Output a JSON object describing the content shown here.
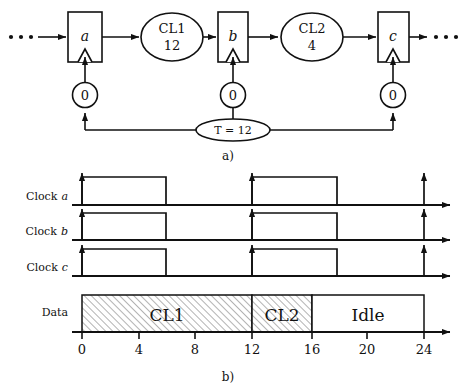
{
  "figure": {
    "panel_a": {
      "caption": "a)",
      "left_ellipsis": "• • •",
      "right_ellipsis": "• • •",
      "registers": [
        {
          "name": "register-a",
          "label": "a"
        },
        {
          "name": "register-b",
          "label": "b"
        },
        {
          "name": "register-c",
          "label": "c"
        }
      ],
      "logic_blocks": [
        {
          "name": "CL1",
          "title": "CL1",
          "delay": "12"
        },
        {
          "name": "CL2",
          "title": "CL2",
          "delay": "4"
        }
      ],
      "buffers": [
        {
          "name": "clock-buffer-a",
          "label": "0"
        },
        {
          "name": "clock-buffer-b",
          "label": "0"
        },
        {
          "name": "clock-buffer-c",
          "label": "0"
        }
      ],
      "clock_source": {
        "label": "T = 12"
      }
    },
    "panel_b": {
      "caption": "b)",
      "rows": [
        {
          "name": "clock-a",
          "label": "Clock a",
          "label_plain": "Clock",
          "label_italic": "a"
        },
        {
          "name": "clock-b",
          "label": "Clock b",
          "label_plain": "Clock",
          "label_italic": "b"
        },
        {
          "name": "clock-c",
          "label": "Clock c",
          "label_plain": "Clock",
          "label_italic": "c"
        },
        {
          "name": "data",
          "label": "Data",
          "label_plain": "Data",
          "label_italic": ""
        }
      ],
      "axis": {
        "ticks": [
          "0",
          "4",
          "8",
          "12",
          "16",
          "20",
          "24"
        ],
        "tick_values": [
          0,
          4,
          8,
          12,
          16,
          20,
          24
        ],
        "min": 0,
        "max": 25
      },
      "clock_waveform": {
        "pulses": [
          {
            "rise": 0,
            "fall": 6
          },
          {
            "rise": 12,
            "fall": 18
          }
        ],
        "final_edge": 24
      },
      "data_segments": [
        {
          "label": "CL1",
          "start": 0,
          "end": 12,
          "hatched": true
        },
        {
          "label": "CL2",
          "start": 12,
          "end": 16,
          "hatched": true
        },
        {
          "label": "Idle",
          "start": 16,
          "end": 24,
          "hatched": false
        }
      ]
    },
    "colors": {
      "line": "#111111",
      "background": "#ffffff",
      "hatch": "#9a9a9a",
      "hatch_fill": "#ffffff"
    }
  }
}
